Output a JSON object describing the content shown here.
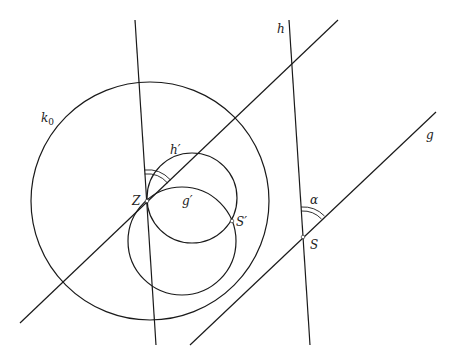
{
  "diagram": {
    "colors": {
      "stroke": "#1a1a1a",
      "background": "#ffffff",
      "label": "#222222"
    },
    "labels": {
      "k0": "k",
      "k0_sub": "0",
      "h_prime": "h′",
      "g_prime": "g′",
      "Z": "Z",
      "S_prime": "S′",
      "alpha": "α",
      "S": "S",
      "h": "h",
      "g": "g"
    },
    "circles": [
      {
        "name": "k0",
        "cx": 150,
        "cy": 201,
        "r": 119
      },
      {
        "name": "h-prime",
        "cx": 192,
        "cy": 198,
        "r": 45
      },
      {
        "name": "g-prime",
        "cx": 182,
        "cy": 241,
        "r": 54
      }
    ],
    "lines": [
      {
        "name": "line-through-Z-vertical",
        "x1": 135,
        "y1": 20,
        "x2": 156,
        "y2": 345
      },
      {
        "name": "line-through-Z-diagonal",
        "x1": 20,
        "y1": 323,
        "x2": 338,
        "y2": 20
      },
      {
        "name": "h",
        "x1": 289,
        "y1": 20,
        "x2": 310,
        "y2": 345
      },
      {
        "name": "g",
        "x1": 190,
        "y1": 345,
        "x2": 436,
        "y2": 112
      }
    ],
    "points": {
      "Z": {
        "x": 147,
        "y": 201
      },
      "S_prime": {
        "x": 232,
        "y": 221
      },
      "S": {
        "x": 303,
        "y": 237
      }
    }
  }
}
